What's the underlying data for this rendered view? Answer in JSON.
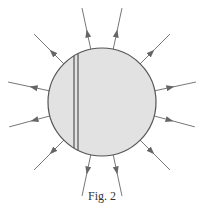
{
  "figure": {
    "caption": "Fig. 2",
    "circle": {
      "cx": 102,
      "cy": 102,
      "r": 54,
      "fill": "#e2e2e2",
      "stroke": "#555555"
    },
    "divider": {
      "x1": 74,
      "x2": 78
    },
    "arrows": [
      {
        "angle": -78
      },
      {
        "angle": -102
      },
      {
        "angle": -45
      },
      {
        "angle": -135
      },
      {
        "angle": -12
      },
      {
        "angle": -168
      },
      {
        "angle": 15
      },
      {
        "angle": 165
      },
      {
        "angle": 45
      },
      {
        "angle": 135
      },
      {
        "angle": 78
      },
      {
        "angle": 102
      }
    ]
  }
}
